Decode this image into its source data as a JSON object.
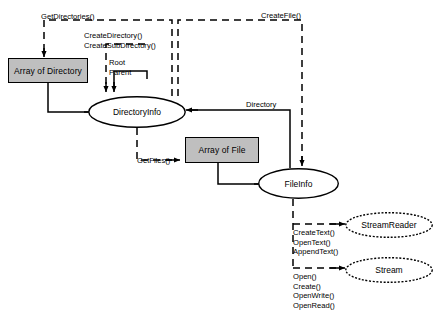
{
  "diagram": {
    "type": "flow-diagram",
    "background": "#ffffff",
    "node_fill": "#bfbfbf",
    "stroke": "#000000",
    "nodes": [
      {
        "id": "array-of-directory",
        "label": "Array of Directory",
        "shape": "rect",
        "x": 8,
        "y": 58,
        "w": 80,
        "h": 25
      },
      {
        "id": "directoryinfo",
        "label": "DirectoryInfo",
        "shape": "ellipse",
        "x": 88,
        "y": 96,
        "w": 98,
        "h": 32
      },
      {
        "id": "array-of-file",
        "label": "Array of File",
        "shape": "rect",
        "x": 185,
        "y": 137,
        "w": 74,
        "h": 26
      },
      {
        "id": "fileinfo",
        "label": "FileInfo",
        "shape": "ellipse",
        "x": 258,
        "y": 168,
        "w": 81,
        "h": 31
      },
      {
        "id": "streamreader",
        "label": "StreamReader",
        "shape": "ellipse",
        "x": 345,
        "y": 212,
        "w": 88,
        "h": 26
      },
      {
        "id": "stream",
        "label": "Stream",
        "shape": "ellipse",
        "x": 345,
        "y": 257,
        "w": 88,
        "h": 26
      }
    ],
    "edge_labels": [
      {
        "id": "get-directories",
        "text": "GetDirectories()",
        "x": 41,
        "y": 12
      },
      {
        "id": "create-directory",
        "text": "CreateDirectory()\nCreateSubDirectory()",
        "x": 84,
        "y": 31
      },
      {
        "id": "root-parent",
        "text": "Root\nParent",
        "x": 109,
        "y": 58
      },
      {
        "id": "create-file",
        "text": "CreateFile()",
        "x": 261,
        "y": 11
      },
      {
        "id": "directory",
        "text": "Directory",
        "x": 246,
        "y": 100
      },
      {
        "id": "get-files",
        "text": "GetFiles()",
        "x": 137,
        "y": 156
      },
      {
        "id": "text-methods",
        "text": "CreateText()\nOpenText()\nAppendText()",
        "x": 293,
        "y": 228
      },
      {
        "id": "stream-methods",
        "text": "Open()\nCreate()\nOpenWrite()\nOpenRead()",
        "x": 293,
        "y": 272
      }
    ]
  }
}
